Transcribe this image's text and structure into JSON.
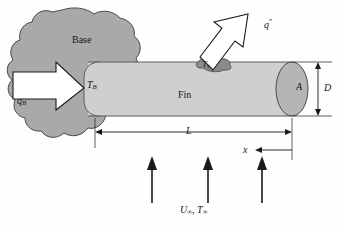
{
  "figure": {
    "background_color": "#fefefe"
  },
  "colors": {
    "base_fill": "#a9a9a9",
    "base_stroke": "#4a4a4a",
    "fin_fill": "#cfcfcf",
    "fin_stroke": "#5a5a5a",
    "tip_fill": "#b5b5b5",
    "patch_fill": "#8a8a8a",
    "arrow_outline_fill": "#ffffff",
    "arrow_outline_stroke": "#1a1a1a",
    "flow_arrow_color": "#1a1a1a",
    "dimension_color": "#1a1a1a",
    "text_color": "#161616"
  },
  "labels": {
    "base": "Base",
    "fin": "Fin",
    "base_temperature": {
      "symbol": "T",
      "subscript": "B"
    },
    "surface_temperature": {
      "symbol": "T",
      "subscript": "s"
    },
    "base_heat_rate": {
      "symbol": "q",
      "subscript": "B"
    },
    "surface_heat_flux": {
      "symbol": "q",
      "superscript": "″"
    },
    "cross_section_area": "A",
    "diameter": "D",
    "length": "L",
    "axial_coordinate": "x",
    "freestream": {
      "velocity": "U",
      "temperature": "T",
      "subscript": "∞",
      "separator": ", "
    }
  },
  "annotations": {
    "base_heat_arrow_direction": "right",
    "flux_arrow_direction": "up-right",
    "x_arrow_direction": "left-from-tip",
    "flow_arrow_direction": "up",
    "flow_arrow_count": 3,
    "dimension_L_span": "base-to-tip",
    "dimension_D_span": "fin-diameter"
  },
  "icons": {
    "base_heat_arrow": "block-arrow-right-icon",
    "flux_arrow": "block-arrow-up-right-icon",
    "flow_arrows": "arrow-up-icon",
    "dimension_line": "dimension-line-icon"
  }
}
